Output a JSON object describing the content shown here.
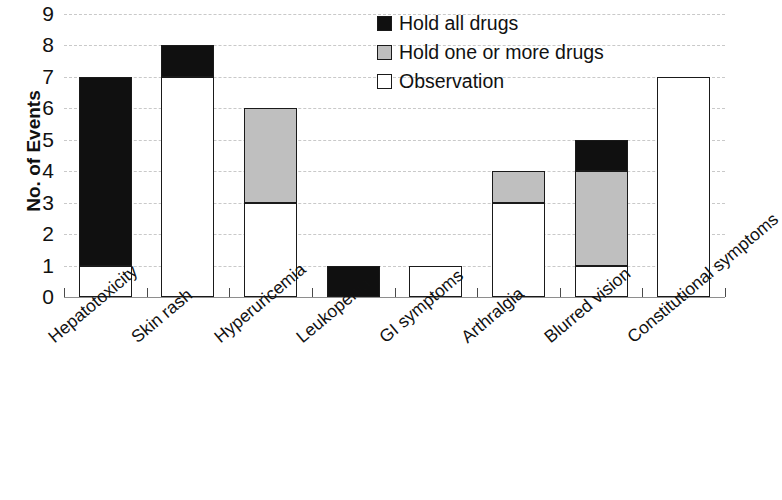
{
  "chart_data": {
    "type": "bar",
    "subtype": "stacked-bar",
    "title": "",
    "xlabel": "",
    "ylabel": "No. of Events",
    "ylim": [
      0,
      9
    ],
    "ytick_labels": [
      "0",
      "1",
      "2",
      "3",
      "4",
      "5",
      "6",
      "7",
      "8",
      "9"
    ],
    "ytick_values": [
      0,
      1,
      2,
      3,
      4,
      5,
      6,
      7,
      8,
      9
    ],
    "grid": "horizontal-dashed",
    "legend_position": "top-right",
    "categories": [
      "Hepatotoxicity",
      "Skin rash",
      "Hyperuricemia",
      "Leukopenia",
      "GI symptoms",
      "Arthralgia",
      "Blurred vision",
      "Constitutional symptoms"
    ],
    "series": [
      {
        "name": "Observation",
        "color": "#ffffff",
        "values": [
          1,
          7,
          3,
          0,
          1,
          3,
          1,
          7
        ]
      },
      {
        "name": "Hold one or more drugs",
        "color": "#bfbfbf",
        "values": [
          0,
          0,
          3,
          0,
          0,
          1,
          3,
          0
        ]
      },
      {
        "name": "Hold all drugs",
        "color": "#101010",
        "values": [
          6,
          1,
          0,
          1,
          0,
          0,
          1,
          0
        ]
      }
    ],
    "totals": [
      7,
      8,
      6,
      1,
      1,
      4,
      5,
      7
    ]
  },
  "legend": {
    "items": [
      {
        "label": "Hold all drugs",
        "color": "#101010"
      },
      {
        "label": "Hold one or more drugs",
        "color": "#bfbfbf"
      },
      {
        "label": "Observation",
        "color": "#ffffff"
      }
    ]
  },
  "axis": {
    "y_title": "No. of Events"
  }
}
